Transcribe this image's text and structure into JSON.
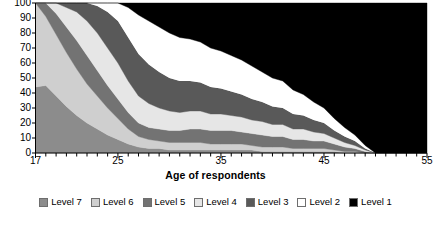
{
  "chart_data": {
    "type": "area",
    "stacked": true,
    "normalized_percent": true,
    "title": "",
    "subtitle": "",
    "xlabel": "Age of respondents",
    "ylabel": "",
    "xlim": [
      17,
      55
    ],
    "ylim": [
      0,
      100
    ],
    "x_tick_labels": [
      "17",
      "25",
      "35",
      "45",
      "55"
    ],
    "x_tick_values": [
      17,
      25,
      35,
      45,
      55
    ],
    "x_minor_tick_step": 1,
    "y_tick_labels": [
      "0",
      "10",
      "20",
      "30",
      "40",
      "50",
      "60",
      "70",
      "80",
      "90",
      "100"
    ],
    "y_tick_values": [
      0,
      10,
      20,
      30,
      40,
      50,
      60,
      70,
      80,
      90,
      100
    ],
    "grid": false,
    "legend_position": "bottom",
    "stack_order_bottom_to_top": [
      "Level 7",
      "Level 6",
      "Level 5",
      "Level 4",
      "Level 3",
      "Level 2",
      "Level 1"
    ],
    "x": [
      17,
      18,
      19,
      20,
      21,
      22,
      23,
      24,
      25,
      26,
      27,
      28,
      29,
      30,
      31,
      32,
      33,
      34,
      35,
      36,
      37,
      38,
      39,
      40,
      41,
      42,
      43,
      44,
      45,
      46,
      47,
      48,
      49,
      50,
      51,
      52,
      53,
      54,
      55
    ],
    "series": [
      {
        "name": "Level 7",
        "color": "#8c8c8c",
        "values": [
          44,
          45,
          38,
          31,
          25,
          20,
          16,
          12,
          9,
          6,
          4,
          3,
          3,
          2,
          2,
          2,
          2,
          2,
          2,
          2,
          2,
          2,
          1,
          1,
          1,
          1,
          1,
          1,
          1,
          1,
          0,
          0,
          0,
          0,
          0,
          0,
          0,
          0,
          0
        ]
      },
      {
        "name": "Level 6",
        "color": "#cfcfcf",
        "values": [
          56,
          46,
          41,
          36,
          31,
          26,
          22,
          18,
          14,
          10,
          7,
          6,
          5,
          5,
          5,
          5,
          5,
          4,
          4,
          4,
          4,
          3,
          3,
          3,
          3,
          2,
          2,
          2,
          2,
          1,
          1,
          1,
          0,
          0,
          0,
          0,
          0,
          0,
          0
        ]
      },
      {
        "name": "Level 5",
        "color": "#737373",
        "values": [
          0,
          9,
          14,
          17,
          19,
          19,
          17,
          15,
          13,
          11,
          9,
          8,
          8,
          8,
          8,
          9,
          9,
          9,
          9,
          9,
          8,
          8,
          8,
          7,
          7,
          6,
          6,
          5,
          5,
          4,
          3,
          2,
          1,
          0,
          0,
          0,
          0,
          0,
          0
        ]
      },
      {
        "name": "Level 4",
        "color": "#e6e6e6",
        "values": [
          0,
          0,
          7,
          13,
          19,
          23,
          25,
          25,
          24,
          21,
          18,
          16,
          14,
          13,
          12,
          12,
          12,
          11,
          11,
          10,
          10,
          9,
          9,
          8,
          8,
          7,
          7,
          6,
          5,
          4,
          3,
          2,
          1,
          0,
          0,
          0,
          0,
          0,
          0
        ]
      },
      {
        "name": "Level 3",
        "color": "#595959",
        "values": [
          0,
          0,
          0,
          3,
          6,
          12,
          18,
          24,
          28,
          29,
          28,
          26,
          24,
          22,
          21,
          20,
          19,
          18,
          17,
          16,
          15,
          14,
          13,
          12,
          11,
          10,
          9,
          8,
          7,
          5,
          4,
          3,
          1,
          0,
          0,
          0,
          0,
          0,
          0
        ]
      },
      {
        "name": "Level 2",
        "color": "#ffffff",
        "values": [
          0,
          0,
          0,
          0,
          0,
          0,
          2,
          6,
          12,
          20,
          26,
          29,
          30,
          30,
          29,
          28,
          27,
          26,
          25,
          24,
          23,
          22,
          20,
          19,
          18,
          16,
          14,
          12,
          10,
          8,
          6,
          4,
          2,
          0,
          0,
          0,
          0,
          0,
          0
        ]
      },
      {
        "name": "Level 1",
        "color": "#000000",
        "values": [
          0,
          0,
          0,
          0,
          0,
          0,
          0,
          0,
          0,
          3,
          8,
          12,
          16,
          20,
          23,
          24,
          26,
          30,
          32,
          35,
          38,
          42,
          46,
          50,
          52,
          58,
          61,
          66,
          70,
          77,
          83,
          88,
          95,
          100,
          100,
          100,
          100,
          100,
          100
        ]
      }
    ],
    "legend": [
      {
        "label": "Level 7",
        "color": "#8c8c8c"
      },
      {
        "label": "Level 6",
        "color": "#cfcfcf"
      },
      {
        "label": "Level 5",
        "color": "#737373"
      },
      {
        "label": "Level 4",
        "color": "#e6e6e6"
      },
      {
        "label": "Level 3",
        "color": "#595959"
      },
      {
        "label": "Level 2",
        "color": "#ffffff"
      },
      {
        "label": "Level 1",
        "color": "#000000"
      }
    ]
  },
  "axis": {
    "x_title": "Age of respondents"
  }
}
